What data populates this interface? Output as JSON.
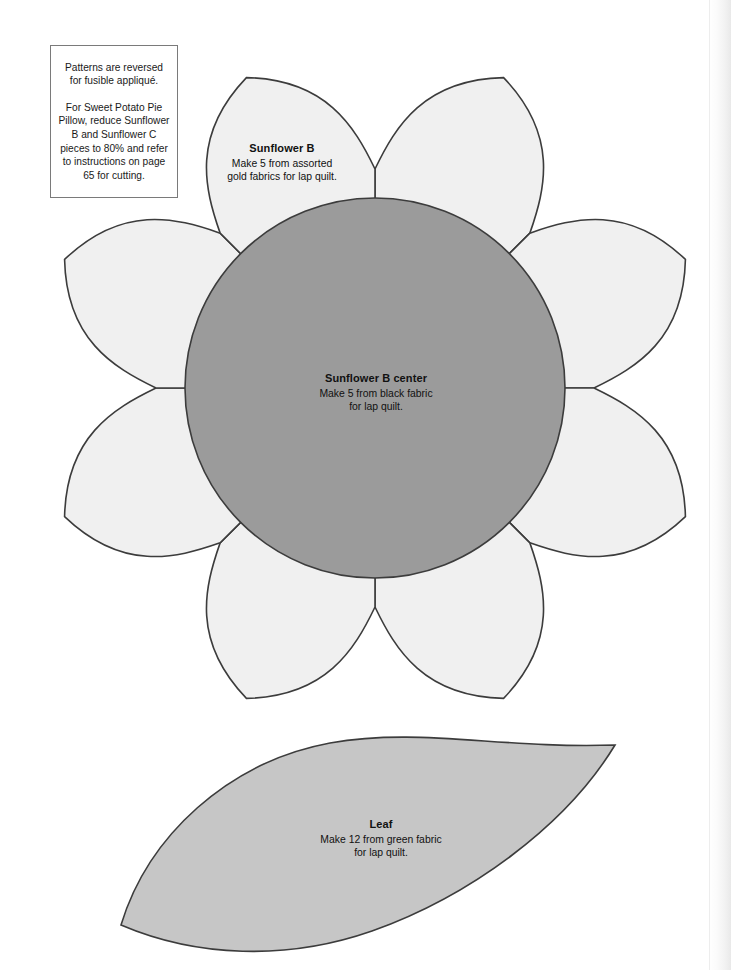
{
  "page": {
    "width": 731,
    "height": 970,
    "background": "#ffffff"
  },
  "note_box": {
    "paragraph_1": "Patterns are reversed for fusible appliqué.",
    "paragraph_2": "For Sweet Potato Pie Pillow, reduce Sunflower B and Sunflower C pieces to 80% and refer to instructions on page 65 for cutting."
  },
  "pieces": [
    {
      "id": "sunflower-b",
      "title": "Sunflower B",
      "line_1": "Make 5 from assorted",
      "line_2": "gold fabrics for lap quilt.",
      "fill": "#f0f0f0",
      "stroke": "#3c3c3c"
    },
    {
      "id": "sunflower-b-center",
      "title": "Sunflower B center",
      "line_1": "Make 5 from black fabric",
      "line_2": "for lap quilt.",
      "fill": "#9b9b9b",
      "stroke": "#3c3c3c"
    },
    {
      "id": "leaf",
      "title": "Leaf",
      "line_1": "Make 12 from green fabric",
      "line_2": "for lap quilt.",
      "fill": "#c6c6c6",
      "stroke": "#3c3c3c"
    }
  ],
  "geometry": {
    "flower": {
      "center_x": 375,
      "center_y": 388,
      "petal_count": 8,
      "petal_tip_radius": 336,
      "petal_notch_radius": 219,
      "center_circle_radius": 190
    },
    "leaf": {
      "left_tip_x": 121,
      "left_tip_y": 925,
      "right_tip_x": 615,
      "right_tip_y": 745
    }
  }
}
